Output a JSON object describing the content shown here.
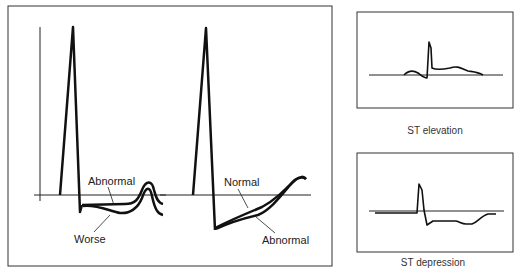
{
  "main_panel": {
    "left_trace": {
      "labels": {
        "upper": "Abnormal",
        "lower": "Worse"
      }
    },
    "right_trace": {
      "labels": {
        "upper": "Normal",
        "lower": "Abnormal"
      }
    }
  },
  "side_panels": [
    {
      "caption": "ST elevation"
    },
    {
      "caption": "ST depression"
    }
  ],
  "colors": {
    "line": "#1a1a1a",
    "border": "#333333",
    "background": "#ffffff"
  }
}
